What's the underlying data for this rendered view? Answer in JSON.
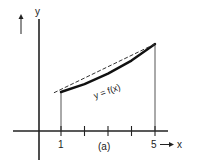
{
  "figure": {
    "caption": "(a)",
    "curve_label": "y = f(x)",
    "y_axis_label": "y",
    "x_axis_label": "x",
    "x_tick_labels": [
      "1",
      "5"
    ],
    "colors": {
      "ink": "#222222",
      "background": "#ffffff"
    }
  },
  "chart_data": {
    "type": "line",
    "title": "",
    "xlabel": "x",
    "ylabel": "y",
    "caption": "(a)",
    "x_ticks": [
      1,
      2,
      3,
      4,
      5
    ],
    "x_tick_labels": {
      "1": "1",
      "5": "5"
    },
    "xlim": [
      -1,
      6
    ],
    "series": [
      {
        "name": "y = f(x)",
        "style": "solid-thick",
        "x": [
          1,
          2,
          3,
          4,
          5
        ],
        "y": [
          1.0,
          1.18,
          1.42,
          1.72,
          2.1
        ]
      },
      {
        "name": "chord",
        "style": "dashed",
        "x": [
          0.7,
          5
        ],
        "y": [
          0.98,
          2.1
        ]
      }
    ],
    "vertical_guides": [
      1,
      5
    ],
    "grid": false
  }
}
